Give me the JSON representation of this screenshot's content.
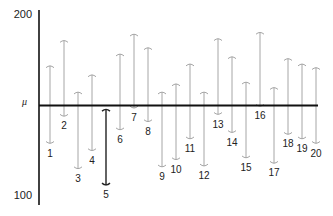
{
  "chart_data": {
    "type": "interval",
    "title": "",
    "xlabel": "",
    "ylabel": "",
    "ylim": [
      100,
      200
    ],
    "yticks": [
      "200",
      "100"
    ],
    "reference_line": {
      "label": "μ",
      "value": 150
    },
    "categories": [
      "1",
      "2",
      "3",
      "4",
      "5",
      "6",
      "7",
      "8",
      "9",
      "10",
      "11",
      "12",
      "13",
      "14",
      "15",
      "16",
      "17",
      "18",
      "19",
      "20"
    ],
    "series": [
      {
        "name": "upper",
        "values": [
          172,
          186,
          157.5,
          167,
          148,
          178.5,
          189.5,
          182,
          157.5,
          162,
          173,
          157.5,
          187,
          177,
          163,
          190.5,
          160,
          176,
          173,
          171
        ]
      },
      {
        "name": "lower",
        "values": [
          129,
          144,
          115,
          125,
          106,
          136.5,
          148.5,
          141,
          116,
          120,
          131.5,
          116.5,
          145,
          135,
          121,
          149.5,
          118,
          134,
          131.5,
          129
        ]
      }
    ],
    "highlighted": [
      "5"
    ],
    "annotation": "Intervals not containing μ are highlighted (interval 5)",
    "grid": false,
    "legend": null
  },
  "axis": {
    "top_label": "200",
    "bottom_label": "100",
    "mu_label": "μ"
  },
  "colors": {
    "interval": "#a6a6a6",
    "highlight": "#222222",
    "axis": "#111111"
  }
}
